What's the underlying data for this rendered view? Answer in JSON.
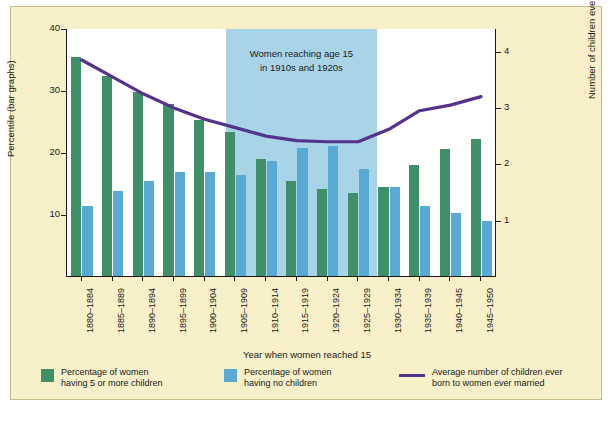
{
  "chart_data": {
    "type": "bar",
    "title": "",
    "xlabel": "Year when women reached 15",
    "ylabel_left": "Percentile (bar graphs)",
    "ylabel_right": "Number of children ever born (line graph)",
    "categories": [
      "1880–1884",
      "1885–1889",
      "1890–1894",
      "1895–1899",
      "1900–1904",
      "1905–1909",
      "1910–1914",
      "1915–1919",
      "1920–1924",
      "1925–1929",
      "1930–1934",
      "1935–1939",
      "1940–1945",
      "1945–1950"
    ],
    "ylim_left": [
      0,
      40
    ],
    "yticks_left": [
      10,
      20,
      30,
      40
    ],
    "ylim_right": [
      0,
      4.4
    ],
    "yticks_right": [
      1,
      2,
      3,
      4
    ],
    "grid": false,
    "legend_position": "bottom",
    "series": [
      {
        "name": "Percentage of women having 5 or more children",
        "type": "bar",
        "color": "#3f9068",
        "axis": "left",
        "values": [
          35.3,
          32.2,
          29.6,
          27.7,
          25.1,
          23.2,
          18.8,
          15.4,
          14.1,
          13.4,
          14.4,
          17.9,
          20.5,
          22.1
        ]
      },
      {
        "name": "Percentage of women having no children",
        "type": "bar",
        "color": "#58a9d4",
        "axis": "left",
        "values": [
          11.3,
          13.7,
          15.3,
          16.8,
          16.8,
          16.3,
          18.5,
          20.6,
          20.9,
          17.3,
          14.3,
          11.3,
          10.1,
          8.9
        ]
      },
      {
        "name": "Average number of children ever born to women ever married",
        "type": "line",
        "color": "#53338c",
        "axis": "right",
        "values": [
          3.85,
          3.55,
          3.25,
          3.0,
          2.8,
          2.65,
          2.5,
          2.42,
          2.4,
          2.4,
          2.62,
          2.95,
          3.05,
          3.2
        ]
      }
    ],
    "annotation": {
      "text_line1": "Women reaching age 15",
      "text_line2": "in 1910s and 1920s",
      "band_start_category": "1905–1909",
      "band_end_category": "1925–1929",
      "band_color": "#a9d4e8"
    }
  },
  "legend": [
    {
      "label_line1": "Percentage of women",
      "label_line2": "having 5 or more children",
      "swatch": "green-swatch"
    },
    {
      "label_line1": "Percentage of women",
      "label_line2": "having no children",
      "swatch": "blue-swatch"
    },
    {
      "label_line1": "Average number of children ever",
      "label_line2": "born to women ever married",
      "swatch": "purple-line-swatch"
    }
  ]
}
